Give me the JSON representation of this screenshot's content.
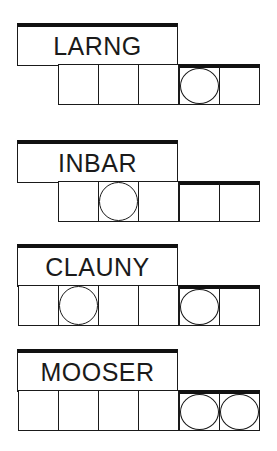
{
  "puzzles": [
    {
      "scrambled": "LARNG",
      "top": 23,
      "letters": 5,
      "circled": [
        3
      ],
      "label_height": 44
    },
    {
      "scrambled": "INBAR",
      "top": 140,
      "letters": 5,
      "circled": [
        1
      ],
      "label_height": 43
    },
    {
      "scrambled": "CLAUNY",
      "top": 244,
      "letters": 6,
      "circled": [
        1,
        4
      ],
      "label_height": 43
    },
    {
      "scrambled": "MOOSER",
      "top": 349,
      "letters": 6,
      "circled": [
        4,
        5
      ],
      "label_height": 43
    }
  ],
  "colors": {
    "ink": "#1a1a1a",
    "background": "#ffffff"
  }
}
